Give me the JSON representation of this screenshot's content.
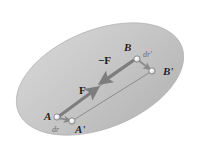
{
  "figure": {
    "caption": "",
    "background_color": "#ffffff",
    "body": {
      "name": "rigid-body-region",
      "shape": "ellipse",
      "fill_color": "#c6c6c6",
      "fill_color_light": "#d2d2d2",
      "fill_color_dark": "#b4b4b4",
      "edge_color": "#9a9a9a",
      "center_x": 100,
      "center_y": 79,
      "radius_x": 88,
      "radius_y": 49,
      "rotation_deg": -22
    },
    "points": [
      {
        "id": "A",
        "label": "A",
        "x": 57,
        "y": 117
      },
      {
        "id": "Ap",
        "label": "A'",
        "x": 72,
        "y": 121
      },
      {
        "id": "B",
        "label": "B",
        "x": 137,
        "y": 59
      },
      {
        "id": "Bp",
        "label": "B'",
        "x": 152,
        "y": 71
      }
    ],
    "point_marker": {
      "name": "node-dot",
      "fill_color": "#f2f2f2",
      "edge_color": "#6b6b6b",
      "radius": 3.0
    },
    "connectors": [
      {
        "id": "A-to-B",
        "from": "A",
        "to": "B",
        "color": "#8c8c8c",
        "width": 1.0
      },
      {
        "id": "Ap-to-Bp",
        "from": "Ap",
        "to": "Bp",
        "color": "#8c8c8c",
        "width": 1.0
      },
      {
        "id": "B-to-Bp",
        "from": "B",
        "to": "Bp",
        "color": "#8c8c8c",
        "width": 1.0
      },
      {
        "id": "A-to-Ap",
        "from": "A",
        "to": "Ap",
        "color": "#8c8c8c",
        "width": 1.0
      }
    ],
    "force_vectors": [
      {
        "id": "F",
        "label": "F",
        "description": "internal force on particle A directed toward B",
        "tail_x": 58,
        "tail_y": 117,
        "head_x": 98,
        "head_y": 88,
        "color": "#7d7d7d",
        "width": 3.2
      },
      {
        "id": "minus-F",
        "label": "−F",
        "description": "reaction force on particle B directed toward A",
        "tail_x": 134,
        "tail_y": 60,
        "head_x": 100,
        "head_y": 83,
        "color": "#7d7d7d",
        "width": 3.2
      }
    ],
    "displacement_vectors": [
      {
        "id": "dr",
        "label": "dr",
        "description": "displacement of A to A'",
        "tail_x": 58,
        "tail_y": 118,
        "head_x": 71,
        "head_y": 121,
        "color": "#8a8a8a",
        "width": 1.6
      },
      {
        "id": "dr-prime",
        "label": "dr'",
        "description": "displacement of B to B'",
        "tail_x": 138,
        "tail_y": 60,
        "head_x": 151,
        "head_y": 70,
        "color": "#8a8a8a",
        "width": 1.6
      }
    ],
    "labels": {
      "A": "A",
      "A_prime": "A'",
      "B": "B",
      "B_prime": "B'",
      "F": "F",
      "minus_F": "−F",
      "dr": "dr",
      "dr_prime": "dr'"
    }
  }
}
